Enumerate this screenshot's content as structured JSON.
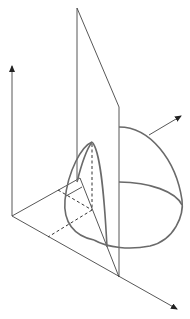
{
  "diagram": {
    "title": "",
    "colors": {
      "line": "#444444",
      "surface": "#6a6a6a",
      "background": "#ffffff"
    },
    "elements": [
      {
        "name": "vertical-axis",
        "type": "arrow"
      },
      {
        "name": "diagonal-axis",
        "type": "arrow"
      },
      {
        "name": "vertical-plane",
        "type": "polygon"
      },
      {
        "name": "hemisphere",
        "type": "surface"
      },
      {
        "name": "cone-section",
        "type": "surface"
      },
      {
        "name": "normal-vector",
        "type": "arrow"
      },
      {
        "name": "projection-lines",
        "type": "dashed"
      }
    ]
  }
}
